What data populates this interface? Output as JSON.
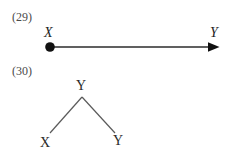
{
  "page": {
    "background_color": "#ffffff",
    "width": 241,
    "height": 157
  },
  "figures": [
    {
      "number_label": "(29)",
      "type": "directed-edge",
      "style": "italic-serif",
      "ink_color": "#1a1a1a",
      "source_node": {
        "label": "X",
        "marker": "filled-circle"
      },
      "target_node": {
        "label": "Y",
        "marker": "arrowhead"
      }
    },
    {
      "number_label": "(30)",
      "type": "binary-tree",
      "style": "upright-serif",
      "ink_color": "#555555",
      "root_node": {
        "label": "Y"
      },
      "leaf_nodes": [
        {
          "label": "X"
        },
        {
          "label": "Y"
        }
      ]
    }
  ],
  "figure_29": {
    "number": "(29)",
    "source_label": "X",
    "target_label": "Y"
  },
  "figure_30": {
    "number": "(30)",
    "root_label": "Y",
    "left_leaf_label": "X",
    "right_leaf_label": "Y"
  }
}
